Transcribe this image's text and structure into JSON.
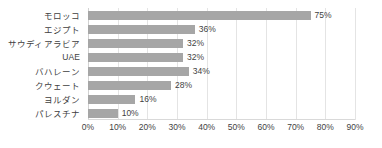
{
  "chart_data": {
    "type": "bar",
    "orientation": "horizontal",
    "title": "",
    "subtitle": "",
    "xlabel": "",
    "ylabel": "",
    "xlim": [
      0,
      90
    ],
    "grid": true,
    "legend": false,
    "legend_position": "none",
    "bar_color": "#a6a6a6",
    "grid_color": "#e4e4e4",
    "text_color": "#3f3f3f",
    "categories": [
      "モロッコ",
      "エジプト",
      "サウディアラビア",
      "UAE",
      "バハレーン",
      "クウェート",
      "ヨルダン",
      "パレスチナ"
    ],
    "values": [
      75,
      36,
      32,
      32,
      34,
      28,
      16,
      10
    ],
    "data_labels": [
      "75%",
      "36%",
      "32%",
      "32%",
      "34%",
      "28%",
      "16%",
      "10%"
    ],
    "xticks": [
      0,
      10,
      20,
      30,
      40,
      50,
      60,
      70,
      80,
      90
    ],
    "xtick_labels": [
      "0%",
      "10%",
      "20%",
      "30%",
      "40%",
      "50%",
      "60%",
      "70%",
      "80%",
      "90%"
    ]
  }
}
